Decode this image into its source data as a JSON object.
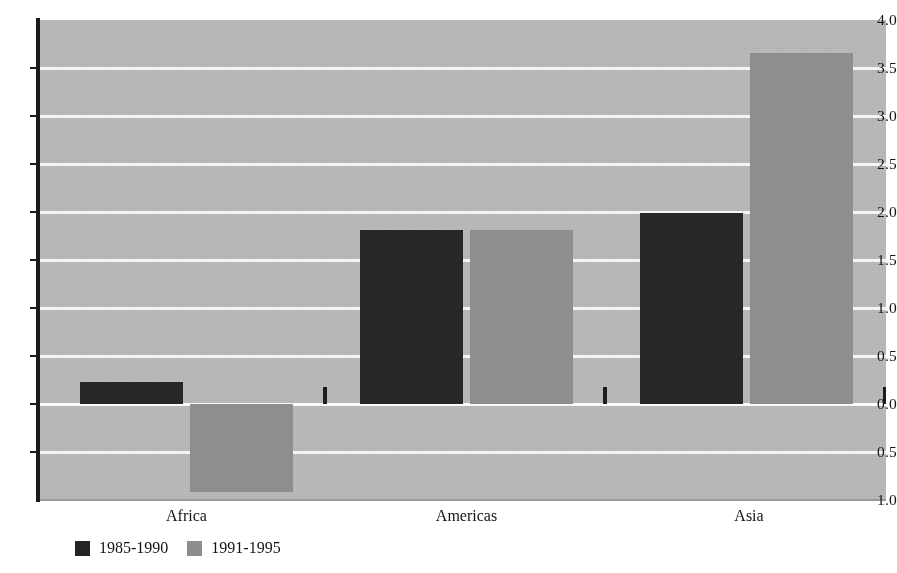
{
  "chart_data": {
    "type": "bar",
    "title": "",
    "subtitle": "",
    "xlabel": "",
    "ylabel": "",
    "categories": [
      "Africa",
      "Americas",
      "Asia"
    ],
    "series": [
      {
        "name": "1985-1990",
        "color": "#272727",
        "values": [
          0.23,
          1.81,
          1.99
        ]
      },
      {
        "name": "1991-1995",
        "color": "#8e8e8e",
        "values": [
          -0.92,
          1.81,
          3.66
        ]
      }
    ],
    "ylim": [
      -1.0,
      4.0
    ],
    "ytick_values": [
      4.0,
      3.5,
      3.0,
      2.5,
      2.0,
      1.5,
      1.0,
      0.5,
      0.0,
      -0.5,
      -1.0
    ],
    "ytick_labels": [
      "4.0",
      "3.5",
      "3.0",
      "2.5",
      "2.0",
      "1.5",
      "1.0",
      "0.5",
      "0.0",
      "0.5",
      "1.0"
    ],
    "grid": true,
    "grid_color": "#f4f4f4",
    "plot_background": "#b7b7b7",
    "legend_position": "bottom-left",
    "legend_entries": [
      "1985-1990",
      "1991-1995"
    ]
  },
  "axis": {
    "y_tick_0": "4.0",
    "y_tick_1": "3.5",
    "y_tick_2": "3.0",
    "y_tick_3": "2.5",
    "y_tick_4": "2.0",
    "y_tick_5": "1.5",
    "y_tick_6": "1.0",
    "y_tick_7": "0.5",
    "y_tick_8": "0.0",
    "y_tick_9": "0.5",
    "y_tick_10": "1.0"
  },
  "categories": {
    "cat_0": "Africa",
    "cat_1": "Americas",
    "cat_2": "Asia"
  },
  "legend": {
    "entry_0": "1985-1990",
    "entry_1": "1991-1995"
  }
}
